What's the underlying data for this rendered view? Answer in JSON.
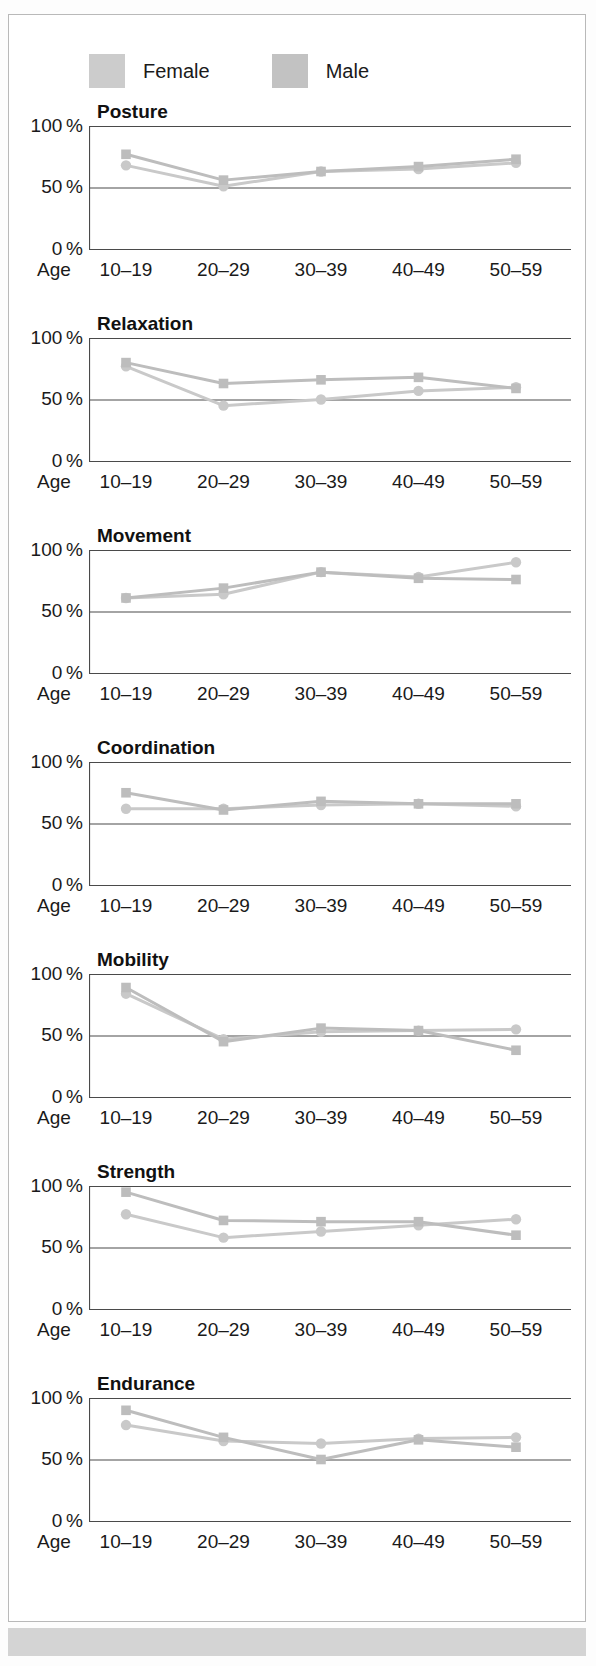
{
  "legend": {
    "items": [
      {
        "label": "Female",
        "marker": "circle",
        "color": "#cccccc",
        "swatch_name": "legend-swatch-female"
      },
      {
        "label": "Male",
        "marker": "square",
        "color": "#c2c2c2",
        "swatch_name": "legend-swatch-male"
      }
    ]
  },
  "axis": {
    "age_prefix": "Age",
    "categories": [
      "10–19",
      "20–29",
      "30–39",
      "40–49",
      "50–59"
    ],
    "yticks": [
      "100 %",
      "50 %",
      "0 %"
    ],
    "ylim": [
      0,
      100
    ]
  },
  "chart_data": [
    {
      "type": "line",
      "title": "Posture",
      "xlabel": "Age",
      "ylabel": "",
      "ylim": [
        0,
        100
      ],
      "grid": true,
      "legend_position": "top",
      "categories": [
        "10–19",
        "20–29",
        "30–39",
        "40–49",
        "50–59"
      ],
      "series": [
        {
          "name": "Female",
          "marker": "circle",
          "values": [
            68,
            51,
            63,
            65,
            70
          ]
        },
        {
          "name": "Male",
          "marker": "square",
          "values": [
            77,
            56,
            63,
            67,
            73
          ]
        }
      ]
    },
    {
      "type": "line",
      "title": "Relaxation",
      "xlabel": "Age",
      "ylabel": "",
      "ylim": [
        0,
        100
      ],
      "grid": true,
      "legend_position": "top",
      "categories": [
        "10–19",
        "20–29",
        "30–39",
        "40–49",
        "50–59"
      ],
      "series": [
        {
          "name": "Female",
          "marker": "circle",
          "values": [
            77,
            45,
            50,
            57,
            60
          ]
        },
        {
          "name": "Male",
          "marker": "square",
          "values": [
            80,
            63,
            66,
            68,
            59
          ]
        }
      ]
    },
    {
      "type": "line",
      "title": "Movement",
      "xlabel": "Age",
      "ylabel": "",
      "ylim": [
        0,
        100
      ],
      "grid": true,
      "legend_position": "top",
      "categories": [
        "10–19",
        "20–29",
        "30–39",
        "40–49",
        "50–59"
      ],
      "series": [
        {
          "name": "Female",
          "marker": "circle",
          "values": [
            61,
            64,
            82,
            78,
            90
          ]
        },
        {
          "name": "Male",
          "marker": "square",
          "values": [
            61,
            69,
            82,
            77,
            76
          ]
        }
      ]
    },
    {
      "type": "line",
      "title": "Coordination",
      "xlabel": "Age",
      "ylabel": "",
      "ylim": [
        0,
        100
      ],
      "grid": true,
      "legend_position": "top",
      "categories": [
        "10–19",
        "20–29",
        "30–39",
        "40–49",
        "50–59"
      ],
      "series": [
        {
          "name": "Female",
          "marker": "circle",
          "values": [
            62,
            62,
            65,
            66,
            64
          ]
        },
        {
          "name": "Male",
          "marker": "square",
          "values": [
            75,
            61,
            68,
            66,
            66
          ]
        }
      ]
    },
    {
      "type": "line",
      "title": "Mobility",
      "xlabel": "Age",
      "ylabel": "",
      "ylim": [
        0,
        100
      ],
      "grid": true,
      "legend_position": "top",
      "categories": [
        "10–19",
        "20–29",
        "30–39",
        "40–49",
        "50–59"
      ],
      "series": [
        {
          "name": "Female",
          "marker": "circle",
          "values": [
            84,
            47,
            53,
            54,
            55
          ]
        },
        {
          "name": "Male",
          "marker": "square",
          "values": [
            89,
            45,
            56,
            54,
            38
          ]
        }
      ]
    },
    {
      "type": "line",
      "title": "Strength",
      "xlabel": "Age",
      "ylabel": "",
      "ylim": [
        0,
        100
      ],
      "grid": true,
      "legend_position": "top",
      "categories": [
        "10–19",
        "20–29",
        "30–39",
        "40–49",
        "50–59"
      ],
      "series": [
        {
          "name": "Female",
          "marker": "circle",
          "values": [
            77,
            58,
            63,
            68,
            73
          ]
        },
        {
          "name": "Male",
          "marker": "square",
          "values": [
            95,
            72,
            71,
            71,
            60
          ]
        }
      ]
    },
    {
      "type": "line",
      "title": "Endurance",
      "xlabel": "Age",
      "ylabel": "",
      "ylim": [
        0,
        100
      ],
      "grid": true,
      "legend_position": "top",
      "categories": [
        "10–19",
        "20–29",
        "30–39",
        "40–49",
        "50–59"
      ],
      "series": [
        {
          "name": "Female",
          "marker": "circle",
          "values": [
            78,
            65,
            63,
            67,
            68
          ]
        },
        {
          "name": "Male",
          "marker": "square",
          "values": [
            90,
            68,
            50,
            66,
            60
          ]
        }
      ]
    }
  ],
  "colors": {
    "female_line": "#c9c9c9",
    "male_line": "#bdbdbd",
    "axis": "#4a4a4a",
    "text": "#1a1a1a",
    "panel_border": "#b9b9b9",
    "bottom_strip": "#d4d4d4"
  }
}
